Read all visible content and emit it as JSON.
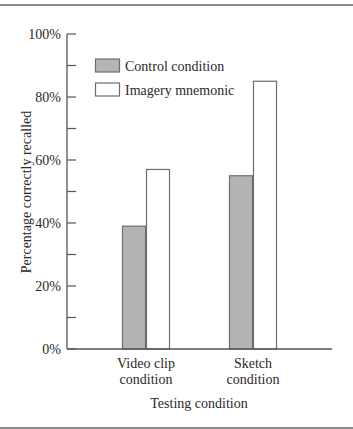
{
  "chart_data": {
    "type": "bar",
    "title": "",
    "xlabel": "Testing condition",
    "ylabel": "Percentage correctly recalled",
    "ylim": [
      0,
      100
    ],
    "yticks": [
      0,
      20,
      40,
      60,
      80,
      100
    ],
    "ytick_labels": [
      "0%",
      "20%",
      "40%",
      "60%",
      "80%",
      "100%"
    ],
    "minor_yticks": [
      10,
      30,
      50,
      70,
      90
    ],
    "grid": false,
    "legend_position": "upper-left inside",
    "categories": [
      "Video clip condition",
      "Sketch condition"
    ],
    "category_labels": [
      [
        "Video clip",
        "condition"
      ],
      [
        "Sketch",
        "condition"
      ]
    ],
    "series": [
      {
        "name": "Control condition",
        "values": [
          39,
          55
        ],
        "color": "#b4b4b4"
      },
      {
        "name": "Imagery mnemonic",
        "values": [
          57,
          85
        ],
        "color": "#ffffff"
      }
    ]
  },
  "colors": {
    "axis": "#555555",
    "bar_outline": "#6e6e6e",
    "rule": "#8a8a8a"
  }
}
